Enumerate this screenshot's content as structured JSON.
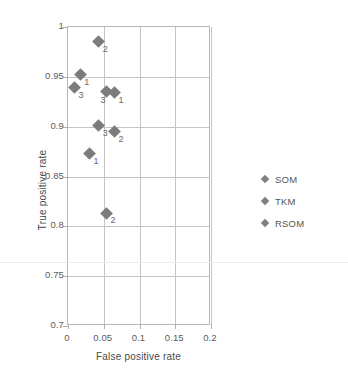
{
  "chart_data": {
    "type": "scatter",
    "title": "",
    "xlabel": "False positive rate",
    "ylabel": "True positive rate",
    "xlim": [
      0,
      0.2
    ],
    "ylim": [
      0.7,
      1
    ],
    "xticks": [
      "0",
      "0.05",
      "0.1",
      "0.15",
      "0.2"
    ],
    "xtick_values": [
      0,
      0.05,
      0.1,
      0.15,
      0.2
    ],
    "yticks": [
      "0.7",
      "0.75",
      "0.8",
      "0.85",
      "0.9",
      "0.95",
      "1"
    ],
    "ytick_values": [
      0.7,
      0.75,
      0.8,
      0.85,
      0.9,
      0.95,
      1
    ],
    "grid": true,
    "legend_position": "right",
    "legend": [
      "SOM",
      "TKM",
      "RSOM"
    ],
    "marker": "diamond",
    "marker_color": "#7c7c7c",
    "series": [
      {
        "name": "SOM",
        "points": [
          {
            "x": 0.017,
            "y": 0.952,
            "label": "1"
          },
          {
            "x": 0.065,
            "y": 0.895,
            "label": "2"
          },
          {
            "x": 0.043,
            "y": 0.901,
            "label": "3"
          }
        ]
      },
      {
        "name": "TKM",
        "points": [
          {
            "x": 0.03,
            "y": 0.873,
            "label": "1"
          },
          {
            "x": 0.054,
            "y": 0.813,
            "label": "2"
          },
          {
            "x": 0.054,
            "y": 0.935,
            "label": "3"
          }
        ]
      },
      {
        "name": "RSOM",
        "points": [
          {
            "x": 0.065,
            "y": 0.934,
            "label": "1"
          },
          {
            "x": 0.043,
            "y": 0.985,
            "label": "2"
          },
          {
            "x": 0.009,
            "y": 0.939,
            "label": "3"
          }
        ]
      }
    ],
    "all_points": [
      {
        "x": 0.043,
        "y": 0.985,
        "label": "2",
        "series": "RSOM",
        "label_pos": "right-below"
      },
      {
        "x": 0.017,
        "y": 0.952,
        "label": "1",
        "series": "SOM",
        "label_pos": "right-below"
      },
      {
        "x": 0.009,
        "y": 0.939,
        "label": "3",
        "series": "RSOM",
        "label_pos": "right-below"
      },
      {
        "x": 0.054,
        "y": 0.935,
        "label": "3",
        "series": "TKM",
        "label_pos": "below-left"
      },
      {
        "x": 0.065,
        "y": 0.934,
        "label": "1",
        "series": "RSOM",
        "label_pos": "right-below"
      },
      {
        "x": 0.043,
        "y": 0.901,
        "label": "3",
        "series": "SOM",
        "label_pos": "right-below"
      },
      {
        "x": 0.065,
        "y": 0.895,
        "label": "2",
        "series": "SOM",
        "label_pos": "right-below"
      },
      {
        "x": 0.03,
        "y": 0.873,
        "label": "1",
        "series": "TKM",
        "label_pos": "right-below"
      },
      {
        "x": 0.054,
        "y": 0.813,
        "label": "2",
        "series": "TKM",
        "label_pos": "right-below"
      }
    ]
  }
}
